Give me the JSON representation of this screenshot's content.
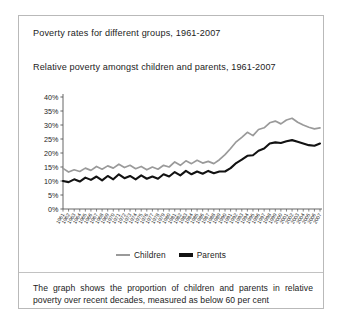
{
  "figure": {
    "outer_title": "Poverty rates for different groups, 1961-2007",
    "caption": "The graph shows the proportion of children and parents in relative poverty over recent decades, measured as below 60 per cent"
  },
  "legend": {
    "position": "bottom-center",
    "items": [
      {
        "label": "Children",
        "color": "#9a9a9a"
      },
      {
        "label": "Parents",
        "color": "#121212"
      }
    ]
  },
  "chart_data": {
    "type": "line",
    "title": "Relative poverty amongst children and parents, 1961-2007",
    "xlabel": "",
    "ylabel": "",
    "ylim": [
      0,
      40
    ],
    "ytick_labels": [
      "0%",
      "5%",
      "10%",
      "15%",
      "20%",
      "25%",
      "30%",
      "35%",
      "40%"
    ],
    "ytick_values": [
      0,
      5,
      10,
      15,
      20,
      25,
      30,
      35,
      40
    ],
    "grid": false,
    "x": [
      1961,
      1962,
      1963,
      1964,
      1965,
      1966,
      1967,
      1968,
      1969,
      1970,
      1971,
      1972,
      1973,
      1974,
      1975,
      1976,
      1977,
      1978,
      1979,
      1980,
      1981,
      1982,
      1983,
      1984,
      1985,
      1986,
      1987,
      1988,
      1989,
      1990,
      1991,
      1992,
      1993,
      1994,
      1995,
      1996,
      1997,
      1998,
      1999,
      2000,
      2001,
      2002,
      2003,
      2004,
      2005,
      2006,
      2007
    ],
    "xtick_labels": [
      "1961",
      "1962",
      "1963",
      "1964",
      "1965",
      "1966",
      "1967",
      "1968",
      "1969",
      "1970",
      "1971",
      "1972",
      "1973",
      "1974",
      "1975",
      "1976",
      "1977",
      "1978",
      "1979",
      "1980",
      "1981",
      "1982",
      "1983",
      "1984",
      "1985",
      "1986",
      "1987",
      "1988",
      "1989",
      "1990",
      "1991",
      "1992",
      "1993",
      "1994",
      "1995",
      "1996",
      "1997",
      "1998",
      "1999",
      "2000",
      "2001",
      "2002",
      "2003",
      "2004",
      "2005",
      "2006",
      "2007"
    ],
    "series": [
      {
        "name": "Children",
        "color": "#9a9a9a",
        "values": [
          14.5,
          13.2,
          14.0,
          13.4,
          14.6,
          13.8,
          15.2,
          14.2,
          15.4,
          14.6,
          16.0,
          14.8,
          15.6,
          14.4,
          15.2,
          14.0,
          15.0,
          14.2,
          15.6,
          15.0,
          16.8,
          15.6,
          17.2,
          16.2,
          17.4,
          16.4,
          17.0,
          16.2,
          17.6,
          19.4,
          21.6,
          24.0,
          25.6,
          27.4,
          26.2,
          28.4,
          29.0,
          30.8,
          31.4,
          30.4,
          31.8,
          32.4,
          31.0,
          30.0,
          29.2,
          28.6,
          29.0
        ]
      },
      {
        "name": "Parents",
        "color": "#121212",
        "values": [
          10.0,
          9.6,
          10.6,
          9.8,
          11.2,
          10.4,
          11.6,
          10.2,
          11.8,
          10.6,
          12.4,
          11.0,
          11.8,
          10.6,
          12.0,
          10.8,
          11.6,
          10.8,
          12.4,
          11.6,
          13.2,
          12.0,
          13.6,
          12.4,
          13.4,
          12.6,
          13.6,
          12.8,
          13.4,
          13.4,
          14.6,
          16.4,
          17.6,
          19.0,
          19.2,
          20.8,
          21.6,
          23.4,
          23.8,
          23.6,
          24.2,
          24.6,
          24.0,
          23.4,
          22.8,
          22.6,
          23.4
        ]
      }
    ]
  }
}
